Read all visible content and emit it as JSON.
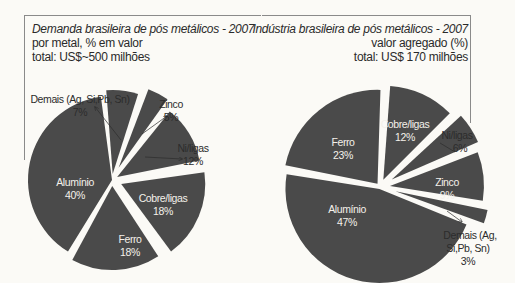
{
  "chart_data": [
    {
      "type": "pie",
      "title": "Demanda brasileira de pós metálicos - 2007",
      "subtitle": [
        "por metal, % em valor",
        "total: US$~500 milhões"
      ],
      "categories": [
        "Demais (Ag, Si,Pb, Sn)",
        "Zinco",
        "Ni/ligas",
        "Cobre/ligas",
        "Ferro",
        "Alumínio"
      ],
      "values": [
        7,
        5,
        12,
        18,
        18,
        40
      ],
      "unit": "%",
      "labels": {
        "demais": "Demais (Ag, Si,Pb, Sn)",
        "demais_pct": "7%",
        "zinco": "Zinco",
        "zinco_pct": "5%",
        "ni": "Ni/ligas",
        "ni_pct": "12%",
        "cobre": "Cobre/ligas",
        "cobre_pct": "18%",
        "ferro": "Ferro",
        "ferro_pct": "18%",
        "aluminio": "Alumínio",
        "aluminio_pct": "40%"
      },
      "slice_color": "#4a4a4a"
    },
    {
      "type": "pie",
      "title": "Indústria brasileira de pós metálicos - 2007",
      "subtitle": [
        "valor agregado (%)",
        "total: US$ 170 milhões"
      ],
      "categories": [
        "Cobre/ligas",
        "Ni/ligas",
        "Zinco",
        "Demais (Ag, Si,Pb, Sn)",
        "Alumínio",
        "Ferro"
      ],
      "values": [
        12,
        6,
        9,
        3,
        47,
        23
      ],
      "unit": "%",
      "labels": {
        "cobre": "Cobre/ligas",
        "cobre_pct": "12%",
        "ni": "Ni/ligas",
        "ni_pct": "6%",
        "zinco": "Zinco",
        "zinco_pct": "9%",
        "demais_1": "Demais (Ag,",
        "demais_2": "Si,Pb, Sn)",
        "demais_pct": "3%",
        "aluminio": "Alumínio",
        "aluminio_pct": "47%",
        "ferro": "Ferro",
        "ferro_pct": "23%"
      },
      "slice_color": "#4a4a4a"
    }
  ]
}
